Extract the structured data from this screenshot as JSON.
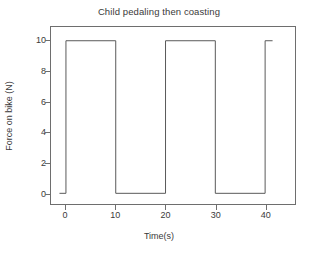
{
  "chart_data": {
    "type": "line",
    "title": "Child pedaling then coasting",
    "xlabel": "Time(s)",
    "ylabel": "Force on bike (N)",
    "xlim": [
      -3,
      46
    ],
    "ylim": [
      -0.7,
      10.9
    ],
    "xticks": [
      0,
      10,
      20,
      30,
      40
    ],
    "xtick_labels": [
      "0",
      "10",
      "20",
      "30",
      "40"
    ],
    "yticks": [
      0,
      2,
      4,
      6,
      8,
      10
    ],
    "ytick_labels": [
      "0",
      "2",
      "4",
      "6",
      "8",
      "10"
    ],
    "grid": false,
    "legend": false,
    "series": [
      {
        "name": "Force on bike",
        "drawstyle": "steps-post",
        "color": "#5a5a5a",
        "x": [
          -1.3,
          0,
          0,
          10,
          10,
          20,
          20,
          30,
          30,
          40,
          40,
          41.5
        ],
        "y": [
          0,
          0,
          10,
          10,
          0,
          0,
          10,
          10,
          0,
          0,
          10,
          10
        ]
      }
    ],
    "annotations": []
  },
  "figure": {
    "background": "#ffffff",
    "line_color": "#5a5a5a",
    "axis_color": "#6e6e6e",
    "text_color": "#3a3a3a"
  }
}
